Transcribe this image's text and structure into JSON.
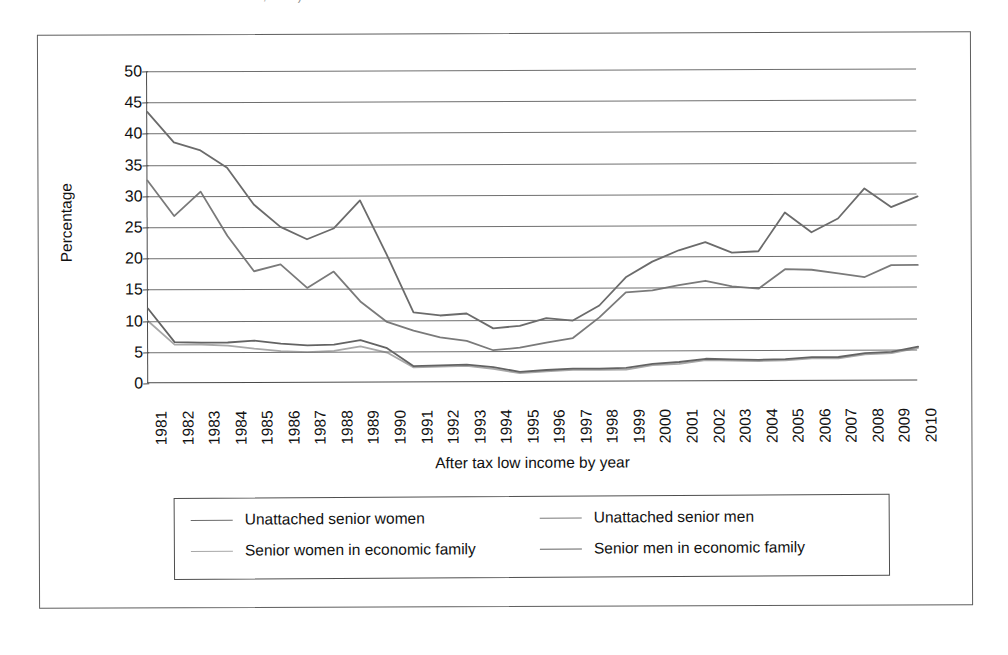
{
  "caption": {
    "text": "Source: Statistics Canada, 2012)"
  },
  "chart_data": {
    "type": "line",
    "title": "",
    "xlabel": "After tax low income by year",
    "ylabel": "Percentage",
    "ylim": [
      0,
      50
    ],
    "ytick_step": 5,
    "yticks": [
      "50",
      "45",
      "40",
      "35",
      "30",
      "25",
      "20",
      "15",
      "10",
      "5",
      "0"
    ],
    "grid": true,
    "legend_position": "bottom",
    "categories": [
      "1981",
      "1982",
      "1983",
      "1984",
      "1985",
      "1986",
      "1987",
      "1988",
      "1989",
      "1990",
      "1991",
      "1992",
      "1993",
      "1994",
      "1995",
      "1996",
      "1997",
      "1998",
      "1999",
      "2000",
      "2001",
      "2002",
      "2003",
      "2004",
      "2005",
      "2006",
      "2007",
      "2008",
      "2009",
      "2010"
    ],
    "series": [
      {
        "name": "Unattached senior women",
        "color": "#6b6b6b",
        "values": [
          43.5,
          38.6,
          37.3,
          34.5,
          28.6,
          25.0,
          23.0,
          24.7,
          29.2,
          20.5,
          11.2,
          10.7,
          11.0,
          8.6,
          9.0,
          10.2,
          9.8,
          12.2,
          16.7,
          19.2,
          21.0,
          22.3,
          20.6,
          20.8,
          27.0,
          23.8,
          26.0,
          30.8,
          27.8,
          29.5
        ]
      },
      {
        "name": "Unattached senior men",
        "color": "#7a7a7a",
        "values": [
          32.5,
          26.8,
          30.7,
          23.6,
          17.9,
          19.0,
          15.2,
          17.8,
          13.0,
          9.7,
          8.3,
          7.2,
          6.6,
          5.1,
          5.5,
          6.3,
          7.0,
          10.3,
          14.3,
          14.6,
          15.4,
          16.1,
          15.2,
          14.8,
          17.9,
          17.8,
          17.2,
          16.6,
          18.5,
          18.5
        ]
      },
      {
        "name": "Senior women in economic family",
        "color": "#a8a8a8",
        "values": [
          10.0,
          6.2,
          6.2,
          6.0,
          5.5,
          5.1,
          4.9,
          5.1,
          5.8,
          4.8,
          2.4,
          2.5,
          2.6,
          2.1,
          1.4,
          1.7,
          1.9,
          1.9,
          1.9,
          2.6,
          2.8,
          3.4,
          3.3,
          3.2,
          3.3,
          3.6,
          3.6,
          4.2,
          4.4,
          5.2
        ]
      },
      {
        "name": "Senior men in economic family",
        "color": "#636363",
        "values": [
          12.0,
          6.6,
          6.5,
          6.5,
          6.8,
          6.3,
          6.0,
          6.1,
          6.8,
          5.5,
          2.6,
          2.7,
          2.8,
          2.4,
          1.6,
          1.9,
          2.1,
          2.1,
          2.2,
          2.8,
          3.1,
          3.6,
          3.5,
          3.4,
          3.5,
          3.8,
          3.8,
          4.4,
          4.6,
          5.4
        ]
      }
    ]
  },
  "legend": {
    "entries": [
      {
        "label": "Unattached senior women",
        "color": "#6b6b6b"
      },
      {
        "label": "Unattached senior men",
        "color": "#7a7a7a"
      },
      {
        "label": "Senior women in economic family",
        "color": "#a8a8a8"
      },
      {
        "label": "Senior men in economic family",
        "color": "#636363"
      }
    ]
  }
}
